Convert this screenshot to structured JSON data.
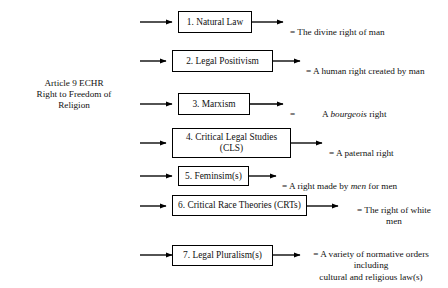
{
  "diagram": {
    "source": {
      "label": "Article 9 ECHR\nRight to Freedom of\nReligion"
    },
    "line_color": "#000000",
    "background_color": "#ffffff",
    "nodes": [
      {
        "id": 1,
        "label": "1.    Natural Law"
      },
      {
        "id": 2,
        "label": "2.    Legal Positivism"
      },
      {
        "id": 3,
        "label": "3.    Marxism"
      },
      {
        "id": 4,
        "label": "4.    Critical Legal Studies\n(CLS)"
      },
      {
        "id": 5,
        "label": "5.    Feminsim(s)"
      },
      {
        "id": 6,
        "label": "6. Critical Race Theories (CRTs)"
      },
      {
        "id": 7,
        "label": "7. Legal Pluralism(s)"
      }
    ],
    "outcomes": [
      {
        "id": 1,
        "prefix": "= ",
        "text": "The divine right of man",
        "italic_word": "",
        "suffix": ""
      },
      {
        "id": 2,
        "prefix": "= ",
        "text": "A human right created by man",
        "italic_word": "",
        "suffix": ""
      },
      {
        "id": 3,
        "equals_only": "=",
        "prefix": "A ",
        "italic_word": "bourgeois",
        "suffix": " right"
      },
      {
        "id": 4,
        "prefix": "= ",
        "text": "A paternal right",
        "italic_word": "",
        "suffix": ""
      },
      {
        "id": 5,
        "prefix": "= A right made by ",
        "italic_word": "men",
        "suffix": " for men"
      },
      {
        "id": 6,
        "prefix": "= ",
        "text": "The right of white\nmen",
        "italic_word": "",
        "suffix": ""
      },
      {
        "id": 7,
        "prefix": "= ",
        "text": "A variety of normative orders\nincluding\ncultural and religious law(s)",
        "italic_word": "",
        "suffix": ""
      }
    ]
  }
}
